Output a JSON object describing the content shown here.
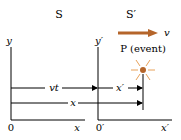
{
  "frames": {
    "s_label": "S",
    "s_prime_label": "S′"
  },
  "axes": {
    "y": "y",
    "x": "x",
    "origin": "0",
    "y_prime": "y′",
    "x_prime": "x′",
    "origin_prime": "0′"
  },
  "velocity": {
    "label": "v",
    "color": "#b5652a"
  },
  "event": {
    "label": "P (event)",
    "color": "#b5652a"
  },
  "distances": {
    "vt": "vt",
    "x_prime": "x′",
    "x": "x"
  }
}
